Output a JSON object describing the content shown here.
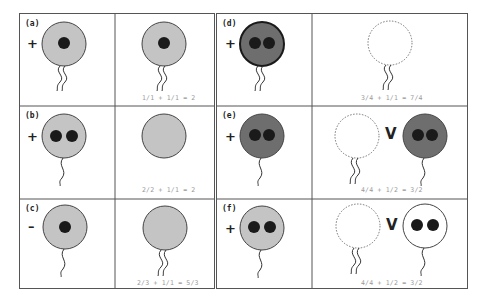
{
  "figure": {
    "colors": {
      "light_gray": "#c4c4c4",
      "dark_gray": "#6e6e6e",
      "nucleus": "#1a1a1a",
      "white": "#ffffff",
      "border": "#444444",
      "equation_text": "#999999"
    },
    "panels": [
      {
        "id": "a",
        "label": "(a)",
        "sign": "+",
        "left_cell": {
          "fill": "light",
          "nuclei": 1,
          "tails": 2
        },
        "right_cells": [
          {
            "fill": "light",
            "nuclei": 1,
            "tails": 2,
            "dashed": false
          }
        ],
        "separator": "",
        "equation": "1/1 + 1/1 = 2"
      },
      {
        "id": "b",
        "label": "(b)",
        "sign": "+",
        "left_cell": {
          "fill": "light",
          "nuclei": 2,
          "tails": 1
        },
        "right_cells": [
          {
            "fill": "light",
            "nuclei": 0,
            "tails": 0,
            "dashed": false
          }
        ],
        "separator": "",
        "equation": "2/2 + 1/1 = 2"
      },
      {
        "id": "c",
        "label": "(c)",
        "sign": "–",
        "left_cell": {
          "fill": "light",
          "nuclei": 1,
          "tails": 1
        },
        "right_cells": [
          {
            "fill": "light",
            "nuclei": 0,
            "tails": 2,
            "dashed": false
          }
        ],
        "separator": "",
        "equation": "2/3 + 1/1 = 5/3"
      },
      {
        "id": "d",
        "label": "(d)",
        "sign": "+",
        "left_cell": {
          "fill": "dark",
          "nuclei": 2,
          "tails": 2
        },
        "right_cells": [
          {
            "fill": "none",
            "nuclei": 0,
            "tails": 2,
            "dashed": true
          }
        ],
        "separator": "",
        "equation": "3/4 + 1/1 = 7/4"
      },
      {
        "id": "e",
        "label": "(e)",
        "sign": "+",
        "left_cell": {
          "fill": "dark",
          "nuclei": 2,
          "tails": 1
        },
        "right_cells": [
          {
            "fill": "none",
            "nuclei": 0,
            "tails": 2,
            "dashed": true
          },
          {
            "fill": "dark",
            "nuclei": 2,
            "tails": 1,
            "dashed": false
          }
        ],
        "separator": "V",
        "equation": "4/4 + 1/2 = 3/2"
      },
      {
        "id": "f",
        "label": "(f)",
        "sign": "+",
        "left_cell": {
          "fill": "light",
          "nuclei": 2,
          "tails": 1
        },
        "right_cells": [
          {
            "fill": "none",
            "nuclei": 0,
            "tails": 2,
            "dashed": true
          },
          {
            "fill": "white",
            "nuclei": 2,
            "tails": 1,
            "dashed": false
          }
        ],
        "separator": "V",
        "equation": "4/4 + 1/2 = 3/2"
      }
    ]
  }
}
